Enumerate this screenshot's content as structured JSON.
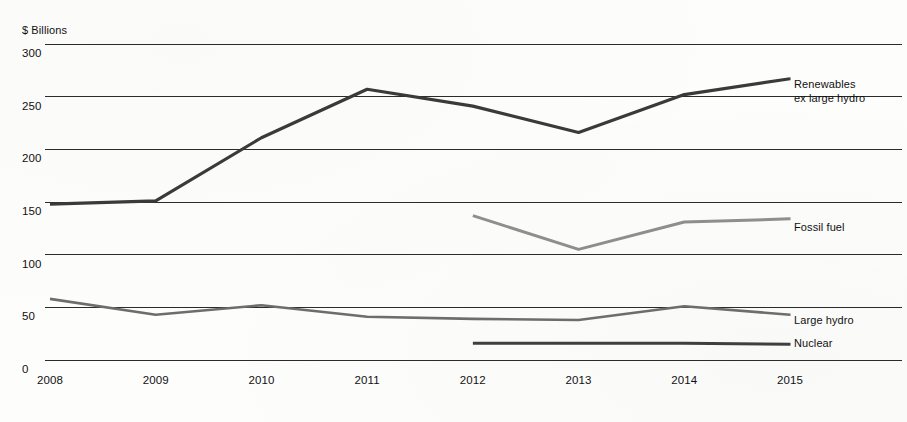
{
  "chart_data": {
    "type": "line",
    "title": "",
    "subtitle": "",
    "xlabel": "",
    "ylabel": "$ Billions",
    "categories": [
      "2008",
      "2009",
      "2010",
      "2011",
      "2012",
      "2013",
      "2014",
      "2015"
    ],
    "x": [
      2008,
      2009,
      2010,
      2011,
      2012,
      2013,
      2014,
      2015
    ],
    "xlim": [
      2008,
      2015
    ],
    "ylim": [
      0,
      300
    ],
    "y_ticks": [
      0,
      50,
      100,
      150,
      200,
      250,
      300
    ],
    "y_tick_labels": [
      "0",
      "50",
      "100",
      "150",
      "200",
      "250",
      "300"
    ],
    "grid": true,
    "grid_axis": "y",
    "legend": "inline-right-of-line-end",
    "series": [
      {
        "name": "Renewables ex large hydro",
        "label_lines": [
          "Renewables",
          "ex large hydro"
        ],
        "color": "#3a3a3a",
        "width": 3.2,
        "values": [
          148,
          151,
          211,
          257,
          241,
          216,
          252,
          267
        ],
        "x": [
          2008,
          2009,
          2010,
          2011,
          2012,
          2013,
          2014,
          2015
        ]
      },
      {
        "name": "Fossil fuel",
        "label_lines": [
          "Fossil fuel"
        ],
        "color": "#8e8e8e",
        "width": 3.0,
        "values": [
          137,
          105,
          131,
          134
        ],
        "x": [
          2012,
          2013,
          2014,
          2015
        ]
      },
      {
        "name": "Large hydro",
        "label_lines": [
          "Large hydro"
        ],
        "color": "#6d6d6d",
        "width": 2.6,
        "values": [
          58,
          43,
          52,
          41,
          39,
          38,
          51,
          43
        ],
        "x": [
          2008,
          2009,
          2010,
          2011,
          2012,
          2013,
          2014,
          2015
        ]
      },
      {
        "name": "Nuclear",
        "label_lines": [
          "Nuclear"
        ],
        "color": "#3f3f3f",
        "width": 3.0,
        "values": [
          16,
          16,
          16,
          15
        ],
        "x": [
          2012,
          2013,
          2014,
          2015
        ]
      }
    ]
  },
  "axis": {
    "y_title": "$ Billions"
  },
  "labels": {
    "renewables_line1": "Renewables",
    "renewables_line2": "ex large hydro",
    "fossil_fuel": "Fossil fuel",
    "large_hydro": "Large hydro",
    "nuclear": "Nuclear"
  }
}
